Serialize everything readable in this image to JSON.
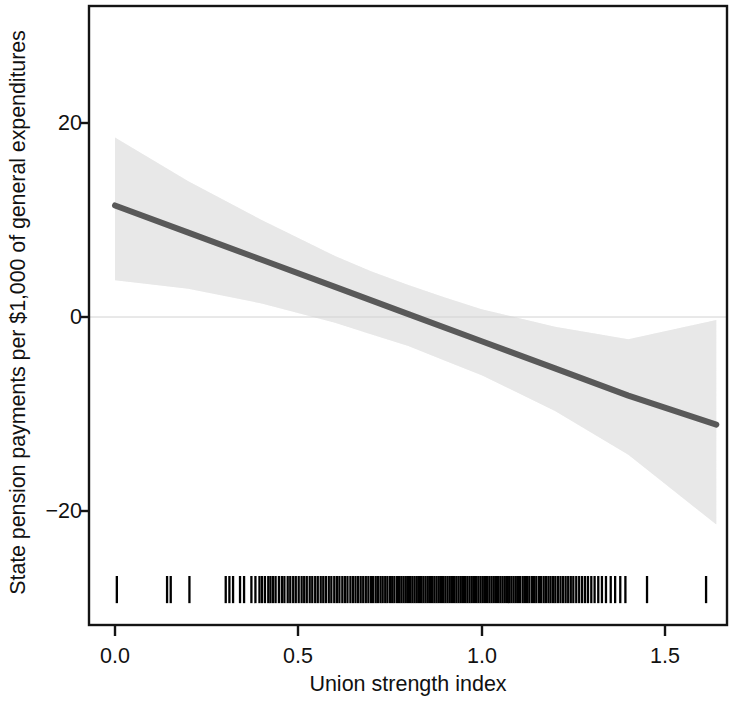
{
  "chart_data": {
    "type": "line",
    "title": "",
    "xlabel": "Union strength index",
    "ylabel": "State pension payments per $1,000 of general expenditures",
    "xlim": [
      -0.045,
      1.745
    ],
    "ylim": [
      -32.3,
      31.2
    ],
    "xticks": [
      0.0,
      0.5,
      1.0,
      1.5
    ],
    "xtick_labels": [
      "0.0",
      "0.5",
      "1.0",
      "1.5"
    ],
    "yticks": [
      20,
      0,
      -20
    ],
    "ytick_labels": [
      "20",
      "0",
      "−20"
    ],
    "grid": false,
    "legend": null,
    "zero_reference_line": {
      "y": 0,
      "color": "#cfcfcf",
      "width": 1
    },
    "series": [
      {
        "name": "Predicted marginal effect",
        "kind": "line",
        "color": "#595959",
        "width": 6,
        "x": [
          0.0,
          0.2,
          0.4,
          0.6,
          0.8,
          1.0,
          1.2,
          1.4,
          1.64
        ],
        "values": [
          11.5,
          8.7,
          5.9,
          3.1,
          0.3,
          -2.5,
          -5.3,
          -8.1,
          -11.1
        ]
      },
      {
        "name": "95% confidence interval",
        "kind": "band",
        "color": "#e8e8e8",
        "x": [
          0.0,
          0.2,
          0.4,
          0.6,
          0.7,
          0.8,
          0.9,
          1.0,
          1.2,
          1.4,
          1.64
        ],
        "upper": [
          18.5,
          14.0,
          10.0,
          6.3,
          4.7,
          3.3,
          2.0,
          0.8,
          -1.0,
          -2.3,
          -0.3
        ],
        "lower": [
          3.8,
          2.9,
          1.4,
          -0.6,
          -1.8,
          -3.0,
          -4.5,
          -6.0,
          -9.7,
          -14.2,
          -21.4
        ]
      }
    ],
    "rug": {
      "name": "Observation rug (union strength index values)",
      "color": "#000000",
      "y_span": [
        -29.5,
        -26.7
      ],
      "values": [
        0.005,
        0.142,
        0.152,
        0.203,
        0.302,
        0.312,
        0.322,
        0.341,
        0.352,
        0.372,
        0.383,
        0.394,
        0.401,
        0.409,
        0.418,
        0.424,
        0.431,
        0.438,
        0.447,
        0.455,
        0.462,
        0.471,
        0.478,
        0.486,
        0.493,
        0.501,
        0.509,
        0.516,
        0.523,
        0.531,
        0.538,
        0.546,
        0.553,
        0.561,
        0.568,
        0.575,
        0.583,
        0.59,
        0.598,
        0.605,
        0.612,
        0.62,
        0.627,
        0.634,
        0.642,
        0.649,
        0.656,
        0.663,
        0.67,
        0.677,
        0.684,
        0.691,
        0.698,
        0.704,
        0.711,
        0.717,
        0.724,
        0.73,
        0.737,
        0.743,
        0.75,
        0.756,
        0.762,
        0.769,
        0.775,
        0.781,
        0.787,
        0.793,
        0.799,
        0.805,
        0.811,
        0.817,
        0.823,
        0.829,
        0.835,
        0.841,
        0.847,
        0.853,
        0.859,
        0.865,
        0.871,
        0.877,
        0.883,
        0.889,
        0.895,
        0.901,
        0.907,
        0.913,
        0.919,
        0.925,
        0.931,
        0.937,
        0.943,
        0.949,
        0.955,
        0.961,
        0.967,
        0.973,
        0.979,
        0.985,
        0.991,
        0.997,
        1.003,
        1.009,
        1.015,
        1.021,
        1.027,
        1.033,
        1.039,
        1.045,
        1.051,
        1.057,
        1.063,
        1.069,
        1.075,
        1.081,
        1.087,
        1.093,
        1.099,
        1.105,
        1.112,
        1.118,
        1.124,
        1.13,
        1.137,
        1.143,
        1.149,
        1.156,
        1.162,
        1.169,
        1.175,
        1.182,
        1.188,
        1.195,
        1.201,
        1.208,
        1.215,
        1.222,
        1.229,
        1.236,
        1.243,
        1.25,
        1.258,
        1.266,
        1.274,
        1.282,
        1.29,
        1.299,
        1.308,
        1.318,
        1.328,
        1.339,
        1.352,
        1.364,
        1.378,
        1.392,
        1.451,
        1.612
      ]
    }
  },
  "axis": {
    "x_title": "Union strength index",
    "y_title": "State pension payments per $1,000 of general expenditures",
    "ytick_0": "20",
    "ytick_1": "0",
    "ytick_2": "−20",
    "xtick_0": "0.0",
    "xtick_1": "0.5",
    "xtick_2": "1.0",
    "xtick_3": "1.5"
  },
  "colors": {
    "line": "#595959",
    "band": "#e8e8e8",
    "rug": "#000000",
    "frame": "#111111",
    "zero_line": "#cfcfcf",
    "background": "#ffffff"
  }
}
